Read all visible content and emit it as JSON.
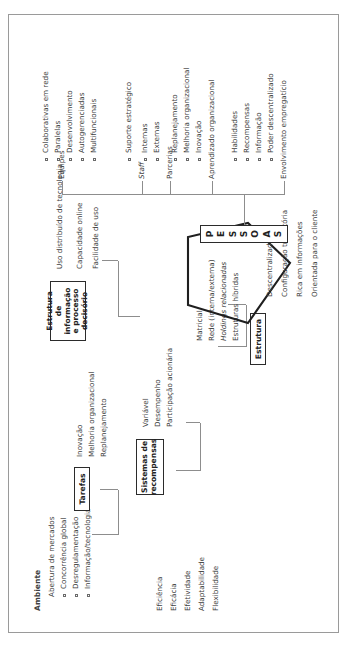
{
  "diagram": {
    "title_hidden": "",
    "environment": {
      "heading": "Ambiente",
      "items": [
        {
          "label": "Abertura de mercados",
          "bullet": false
        },
        {
          "label": "Concorrência global",
          "bullet": true
        },
        {
          "label": "Desregulamentação",
          "bullet": true
        },
        {
          "label": "Informação/tecnologia",
          "bullet": true
        }
      ]
    },
    "outcomes": {
      "items": [
        "Eficiência",
        "Eficácia",
        "Efetividade",
        "Adaptabilidade",
        "Flexibilidade"
      ]
    },
    "structure": {
      "box_label": "Estrutura",
      "types": [
        {
          "label": "Matricial",
          "italic": false
        },
        {
          "label": "Rede (interna/externa)",
          "italic": false
        },
        {
          "label": "Holdings relacionadas",
          "italic": true
        },
        {
          "label": "Estruturas híbridas",
          "italic": false
        }
      ],
      "pentagon_attributes": [
        "Descentralizada",
        "Configuração transitória",
        "Rica em informações",
        "Orientada para o cliente"
      ]
    },
    "people": {
      "box_label_letters": [
        "P",
        "E",
        "S",
        "S",
        "O",
        "A",
        "S"
      ],
      "box_label": "PESSOAS",
      "branches": [
        {
          "name": "Equipes",
          "items": [
            "Colaborativas em rede",
            "Paralelas",
            "Desenvolvimento",
            "Autogerenciadas",
            "Multifuncionais"
          ]
        },
        {
          "name": "Staff",
          "italic": true,
          "items": [
            "Suporte estratégico"
          ]
        },
        {
          "name": "Parcerias",
          "items": [
            "Externas",
            "Internas"
          ]
        },
        {
          "name": "Aprendizado organizacional",
          "items": [
            "Inovação",
            "Melhoria organizacional",
            "Replanejamento"
          ]
        },
        {
          "name": "Envolvimento empregatício",
          "items": [
            "Poder descentralizado",
            "Informação",
            "Recompensas",
            "Habilidades"
          ]
        }
      ]
    },
    "tasks": {
      "box_label": "Tarefas",
      "items": [
        "Inovação",
        "Melhoria organizacional",
        "Replanejamento"
      ]
    },
    "rewards": {
      "box_label": "Sistemas de recompensas",
      "items": [
        "Variável",
        "Desempenho",
        "Participação acionária"
      ]
    },
    "information": {
      "box_label": "Estrutura de informação e processo decisório",
      "items": [
        "Uso distribuído de tecnologia",
        "Capacidade online",
        "Facilidade de uso"
      ]
    }
  }
}
